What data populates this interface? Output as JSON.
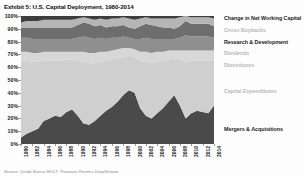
{
  "title": "Exhibit 5: U.S. Capital Deployment, 1980-2014",
  "source": "Source: Credit Suisse HOLT, Thomson Reuters DataStream.",
  "legend": {
    "items": [
      {
        "label": "Change in Net Working Capital",
        "color": "#3d3d3d",
        "tone": "dark",
        "top": 3
      },
      {
        "label": "Gross Buybacks",
        "color": "#b5b5b5",
        "tone": "light",
        "top": 15
      },
      {
        "label": "Research & Development",
        "color": "#6e6e6e",
        "tone": "dark",
        "top": 27
      },
      {
        "label": "Dividends",
        "color": "#8f8f8f",
        "tone": "light",
        "top": 38
      },
      {
        "label": "Divestitures",
        "color": "#d7d7d7",
        "tone": "light",
        "top": 50
      },
      {
        "label": "Capital Expenditures",
        "color": "#cfcfcf",
        "tone": "light",
        "top": 76
      },
      {
        "label": "Mergers & Acquisitions",
        "color": "#4a4a4a",
        "tone": "dark",
        "top": 114
      }
    ]
  },
  "chart_data": {
    "type": "area",
    "title": "Exhibit 5: U.S. Capital Deployment, 1980-2014",
    "xlabel": "",
    "ylabel": "",
    "ylim": [
      0,
      100
    ],
    "ytick_labels": [
      "0%",
      "10%",
      "20%",
      "30%",
      "40%",
      "50%",
      "60%",
      "70%",
      "80%",
      "90%",
      "100%"
    ],
    "ytick_values": [
      0,
      10,
      20,
      30,
      40,
      50,
      60,
      70,
      80,
      90,
      100
    ],
    "grid": false,
    "stacked": true,
    "stack_order_bottom_to_top": [
      "Mergers & Acquisitions",
      "Capital Expenditures",
      "Divestitures",
      "Dividends",
      "Research & Development",
      "Gross Buybacks",
      "Change in Net Working Capital"
    ],
    "x": [
      1980,
      1981,
      1982,
      1983,
      1984,
      1985,
      1986,
      1987,
      1988,
      1989,
      1990,
      1991,
      1992,
      1993,
      1994,
      1995,
      1996,
      1997,
      1998,
      1999,
      2000,
      2001,
      2002,
      2003,
      2004,
      2005,
      2006,
      2007,
      2008,
      2009,
      2010,
      2011,
      2012,
      2013,
      2014
    ],
    "xtick_labels": [
      "1980",
      "1982",
      "1984",
      "1986",
      "1988",
      "1990",
      "1992",
      "1994",
      "1996",
      "1998",
      "2000",
      "2002",
      "2004",
      "2006",
      "2008",
      "2010",
      "2012",
      "2014"
    ],
    "series": [
      {
        "name": "Mergers & Acquisitions",
        "color": "#4a4a4a",
        "values": [
          5,
          8,
          10,
          12,
          18,
          20,
          22,
          21,
          25,
          27,
          22,
          16,
          15,
          18,
          22,
          26,
          29,
          33,
          38,
          42,
          40,
          28,
          22,
          20,
          24,
          28,
          33,
          38,
          30,
          20,
          24,
          26,
          25,
          24,
          30
        ]
      },
      {
        "name": "Capital Expenditures",
        "color": "#cfcfcf",
        "values": [
          60,
          57,
          54,
          52,
          47,
          45,
          43,
          44,
          41,
          39,
          43,
          48,
          48,
          45,
          42,
          39,
          37,
          34,
          30,
          27,
          28,
          37,
          42,
          43,
          40,
          37,
          33,
          29,
          36,
          44,
          41,
          39,
          40,
          41,
          36
        ]
      },
      {
        "name": "Divestitures",
        "color": "#d7d7d7",
        "values": [
          7,
          7,
          7,
          7,
          7,
          7,
          7,
          7,
          6,
          6,
          7,
          8,
          8,
          8,
          8,
          7,
          7,
          7,
          7,
          6,
          6,
          7,
          8,
          8,
          8,
          7,
          7,
          6,
          7,
          9,
          8,
          8,
          8,
          8,
          7
        ]
      },
      {
        "name": "Dividends",
        "color": "#8f8f8f",
        "values": [
          11,
          11,
          11,
          11,
          10,
          10,
          10,
          10,
          10,
          10,
          11,
          12,
          12,
          11,
          11,
          10,
          10,
          9,
          9,
          8,
          8,
          10,
          11,
          11,
          10,
          10,
          9,
          9,
          10,
          12,
          11,
          11,
          11,
          11,
          10
        ]
      },
      {
        "name": "Research & Development",
        "color": "#6e6e6e",
        "values": [
          8,
          8,
          9,
          9,
          9,
          9,
          9,
          9,
          9,
          9,
          10,
          11,
          11,
          10,
          10,
          9,
          9,
          9,
          9,
          8,
          8,
          10,
          11,
          11,
          10,
          9,
          9,
          8,
          9,
          11,
          10,
          10,
          10,
          10,
          9
        ]
      },
      {
        "name": "Gross Buybacks",
        "color": "#b5b5b5",
        "values": [
          4,
          5,
          5,
          5,
          6,
          6,
          6,
          6,
          6,
          6,
          5,
          4,
          4,
          5,
          5,
          6,
          6,
          6,
          6,
          7,
          7,
          6,
          5,
          5,
          6,
          7,
          7,
          8,
          7,
          4,
          5,
          5,
          5,
          5,
          6
        ]
      },
      {
        "name": "Change in Net Working Capital",
        "color": "#3d3d3d",
        "values": [
          5,
          4,
          4,
          4,
          3,
          3,
          3,
          3,
          3,
          3,
          2,
          1,
          2,
          3,
          2,
          3,
          2,
          2,
          1,
          2,
          3,
          2,
          1,
          2,
          2,
          2,
          2,
          2,
          1,
          0,
          1,
          1,
          1,
          1,
          2
        ]
      }
    ]
  }
}
